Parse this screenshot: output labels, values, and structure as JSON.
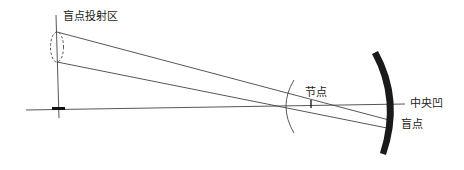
{
  "diagram": {
    "labels": {
      "blind_spot_projection": "盲点投射区",
      "nodal_point": "节点",
      "fovea": "中央凹",
      "blind_spot": "盲点"
    },
    "colors": {
      "line": "#444444",
      "retina": "#1a1a1a",
      "text": "#222222",
      "background": "#ffffff"
    }
  }
}
